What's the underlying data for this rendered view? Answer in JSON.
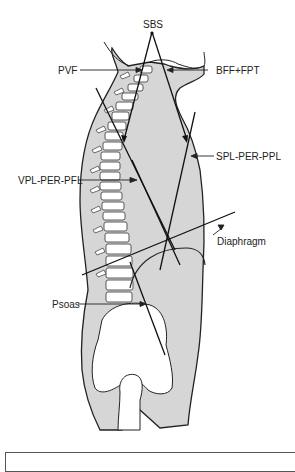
{
  "figure": {
    "labels": {
      "sbs": "SBS",
      "pvf": "PVF",
      "bff_fpt": "BFF+FPT",
      "spl_per_ppl": "SPL-PER-PPL",
      "vpl_per_pfl": "VPL-PER-PFL",
      "diaphragm": "Diaphragm",
      "psoas": "Psoas"
    },
    "colors": {
      "body_fill": "#d6d6d6",
      "bone_fill": "#ffffff",
      "outline": "#222222",
      "background": "#ffffff"
    }
  },
  "caption": {
    "text": ""
  }
}
